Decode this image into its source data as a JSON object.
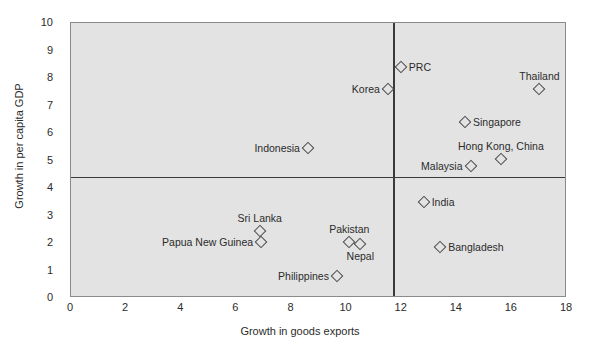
{
  "chart_data": {
    "type": "scatter",
    "title": "",
    "xlabel": "Growth in goods exports",
    "ylabel": "Growth in per capita GDP",
    "xlim": [
      0,
      18
    ],
    "ylim": [
      0,
      10
    ],
    "xticks": [
      "0",
      "2",
      "4",
      "6",
      "8",
      "10",
      "12",
      "14",
      "16",
      "18"
    ],
    "yticks": [
      "0",
      "1",
      "2",
      "3",
      "4",
      "5",
      "6",
      "7",
      "8",
      "9",
      "10"
    ],
    "grid": false,
    "legend": "none",
    "plot_background": "#e3e3e3",
    "marker_shape": "diamond-open",
    "reference_lines": {
      "vertical_x": 11.7,
      "horizontal_y": 4.4
    },
    "points": [
      {
        "name": "PRC",
        "x": 11.97,
        "y": 8.4,
        "label_pos": "right"
      },
      {
        "name": "Korea",
        "x": 11.5,
        "y": 7.6,
        "label_pos": "left"
      },
      {
        "name": "Thailand",
        "x": 17.0,
        "y": 7.6,
        "label_pos": "above"
      },
      {
        "name": "Singapore",
        "x": 14.3,
        "y": 6.4,
        "label_pos": "right"
      },
      {
        "name": "Hong Kong, China",
        "x": 15.6,
        "y": 5.05,
        "label_pos": "above"
      },
      {
        "name": "Malaysia",
        "x": 14.5,
        "y": 4.8,
        "label_pos": "left"
      },
      {
        "name": "Indonesia",
        "x": 8.6,
        "y": 5.45,
        "label_pos": "left"
      },
      {
        "name": "India",
        "x": 12.8,
        "y": 3.5,
        "label_pos": "right"
      },
      {
        "name": "Bangladesh",
        "x": 13.4,
        "y": 1.85,
        "label_pos": "right"
      },
      {
        "name": "Sri Lanka",
        "x": 6.85,
        "y": 2.45,
        "label_pos": "above"
      },
      {
        "name": "Pakistan",
        "x": 10.1,
        "y": 2.05,
        "label_pos": "above"
      },
      {
        "name": "Nepal",
        "x": 10.5,
        "y": 1.95,
        "label_pos": "below"
      },
      {
        "name": "Papua New Guinea",
        "x": 6.9,
        "y": 2.05,
        "label_pos": "left"
      },
      {
        "name": "Philippines",
        "x": 9.65,
        "y": 0.8,
        "label_pos": "left"
      }
    ]
  }
}
